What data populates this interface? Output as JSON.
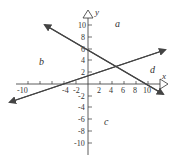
{
  "diagram": {
    "type": "coordinate-plane",
    "axes": {
      "x_label": "x",
      "y_label": "y",
      "x_ticks": [
        "-10",
        "-4",
        "-2",
        "2",
        "4",
        "6",
        "8",
        "10"
      ],
      "y_ticks": [
        "10",
        "8",
        "6",
        "4",
        "2",
        "-2",
        "-4",
        "-6",
        "-8",
        "-10"
      ],
      "range": [
        -11,
        11
      ]
    },
    "lines": [
      {
        "name": "decreasing-line",
        "y_intercept": 6,
        "x_intercept": 10,
        "slope": -0.6
      },
      {
        "name": "increasing-line",
        "y_intercept": 1.5,
        "x_intercept": -4,
        "slope": 0.375
      }
    ],
    "regions": {
      "a": "a",
      "b": "b",
      "c": "c",
      "d": "d"
    },
    "colors": {
      "line": "#444444",
      "axis": "#333333"
    }
  }
}
